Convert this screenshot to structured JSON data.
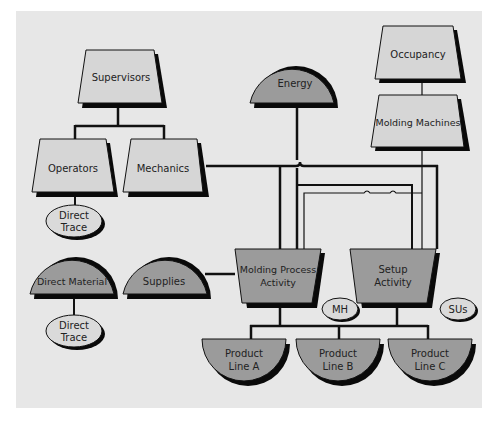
{
  "colors": {
    "page": "#ffffff",
    "panel": "#e7e7e7",
    "resource_fill": "#d6d6d6",
    "dark_fill": "#9b9b9b",
    "oval_fill": "#dadada",
    "line": "#111111",
    "shadow": "#0a0a0a"
  },
  "nodes": {
    "supervisors": {
      "label": "Supervisors"
    },
    "operators": {
      "label": "Operators"
    },
    "mechanics": {
      "label": "Mechanics"
    },
    "direct_trace_1": {
      "line1": "Direct",
      "line2": "Trace"
    },
    "direct_material": {
      "label": "Direct Material"
    },
    "direct_trace_2": {
      "line1": "Direct",
      "line2": "Trace"
    },
    "supplies": {
      "label": "Supplies"
    },
    "energy": {
      "label": "Energy"
    },
    "occupancy": {
      "label": "Occupancy"
    },
    "molding_machines": {
      "label": "Molding Machines"
    },
    "molding_process": {
      "line1": "Molding Process",
      "line2": "Activity"
    },
    "setup": {
      "line1": "Setup",
      "line2": "Activity"
    },
    "mh": {
      "label": "MH"
    },
    "sus": {
      "label": "SUs"
    },
    "product_a": {
      "line1": "Product",
      "line2": "Line A"
    },
    "product_b": {
      "line1": "Product",
      "line2": "Line B"
    },
    "product_c": {
      "line1": "Product",
      "line2": "Line C"
    }
  }
}
